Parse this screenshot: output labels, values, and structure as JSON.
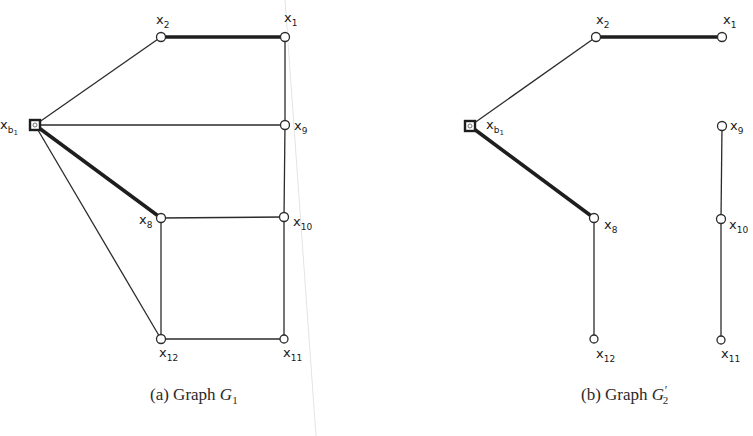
{
  "figure": {
    "colors": {
      "ink": "#2b2b2b",
      "background": "#ffffff",
      "fold_line": "#e3e3e3"
    },
    "graphs": [
      {
        "id": "G1",
        "caption": {
          "prefix": "(a) Graph ",
          "symbol": "G",
          "subscript": "1",
          "prime": ""
        },
        "nodes": [
          {
            "id": "xb1",
            "label": "x",
            "sub": "b₁",
            "shape": "square",
            "x": 35,
            "y": 125
          },
          {
            "id": "x2",
            "label": "x",
            "sub": "2",
            "shape": "circle",
            "x": 161,
            "y": 37
          },
          {
            "id": "x1",
            "label": "x",
            "sub": "1",
            "shape": "circle",
            "x": 285,
            "y": 37
          },
          {
            "id": "x9",
            "label": "x",
            "sub": "9",
            "shape": "circle",
            "x": 285,
            "y": 125
          },
          {
            "id": "x8",
            "label": "x",
            "sub": "8",
            "shape": "circle",
            "x": 161,
            "y": 218
          },
          {
            "id": "x10",
            "label": "x",
            "sub": "10",
            "shape": "circle",
            "x": 284,
            "y": 217
          },
          {
            "id": "x12",
            "label": "x",
            "sub": "12",
            "shape": "circle",
            "x": 161,
            "y": 339
          },
          {
            "id": "x11",
            "label": "x",
            "sub": "11",
            "shape": "circle",
            "x": 284,
            "y": 339
          }
        ],
        "edges": [
          {
            "from": "xb1",
            "to": "x2",
            "bold": false
          },
          {
            "from": "x2",
            "to": "x1",
            "bold": true
          },
          {
            "from": "xb1",
            "to": "x9",
            "bold": false
          },
          {
            "from": "xb1",
            "to": "x8",
            "bold": true
          },
          {
            "from": "xb1",
            "to": "x12",
            "bold": false
          },
          {
            "from": "x1",
            "to": "x9",
            "bold": false
          },
          {
            "from": "x9",
            "to": "x10",
            "bold": false
          },
          {
            "from": "x10",
            "to": "x11",
            "bold": false
          },
          {
            "from": "x8",
            "to": "x10",
            "bold": false
          },
          {
            "from": "x8",
            "to": "x12",
            "bold": false
          },
          {
            "from": "x12",
            "to": "x11",
            "bold": false
          }
        ]
      },
      {
        "id": "G2prime",
        "caption": {
          "prefix": "(b) Graph ",
          "symbol": "G",
          "subscript": "2",
          "prime": "′"
        },
        "nodes": [
          {
            "id": "xb1",
            "label": "x",
            "sub": "b₁",
            "shape": "square",
            "x": 470,
            "y": 126
          },
          {
            "id": "x2",
            "label": "x",
            "sub": "2",
            "shape": "circle",
            "x": 596,
            "y": 37
          },
          {
            "id": "x1",
            "label": "x",
            "sub": "1",
            "shape": "circle",
            "x": 722,
            "y": 37
          },
          {
            "id": "x9",
            "label": "x",
            "sub": "9",
            "shape": "circle",
            "x": 722,
            "y": 126
          },
          {
            "id": "x8",
            "label": "x",
            "sub": "8",
            "shape": "circle",
            "x": 594,
            "y": 218
          },
          {
            "id": "x10",
            "label": "x",
            "sub": "10",
            "shape": "circle",
            "x": 721,
            "y": 219
          },
          {
            "id": "x12",
            "label": "x",
            "sub": "12",
            "shape": "circle",
            "x": 594,
            "y": 339
          },
          {
            "id": "x11",
            "label": "x",
            "sub": "11",
            "shape": "circle",
            "x": 721,
            "y": 340
          }
        ],
        "edges": [
          {
            "from": "xb1",
            "to": "x2",
            "bold": false
          },
          {
            "from": "x2",
            "to": "x1",
            "bold": true
          },
          {
            "from": "xb1",
            "to": "x8",
            "bold": true
          },
          {
            "from": "x8",
            "to": "x12",
            "bold": false
          },
          {
            "from": "x9",
            "to": "x10",
            "bold": false
          },
          {
            "from": "x10",
            "to": "x11",
            "bold": false
          }
        ]
      }
    ]
  },
  "labels": {
    "a": {
      "xb1": {
        "x": "x",
        "sub": "b",
        "subsub": "1"
      },
      "x2": {
        "x": "x",
        "sub": "2"
      },
      "x1": {
        "x": "x",
        "sub": "1"
      },
      "x9": {
        "x": "x",
        "sub": "9"
      },
      "x8": {
        "x": "x",
        "sub": "8"
      },
      "x10": {
        "x": "x",
        "sub": "10"
      },
      "x12": {
        "x": "x",
        "sub": "12"
      },
      "x11": {
        "x": "x",
        "sub": "11"
      }
    },
    "b": {
      "xb1": {
        "x": "x",
        "sub": "b",
        "subsub": "1"
      },
      "x2": {
        "x": "x",
        "sub": "2"
      },
      "x1": {
        "x": "x",
        "sub": "1"
      },
      "x9": {
        "x": "x",
        "sub": "9"
      },
      "x8": {
        "x": "x",
        "sub": "8"
      },
      "x10": {
        "x": "x",
        "sub": "10"
      },
      "x12": {
        "x": "x",
        "sub": "12"
      },
      "x11": {
        "x": "x",
        "sub": "11"
      }
    }
  },
  "captions": {
    "a": {
      "prefix": "(a) Graph ",
      "symbol": "G",
      "subscript": "1"
    },
    "b": {
      "prefix": "(b) Graph ",
      "symbol": "G",
      "prime": "′",
      "subscript": "2"
    }
  }
}
